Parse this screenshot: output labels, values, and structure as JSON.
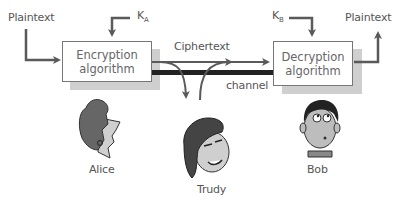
{
  "diagram": {
    "left_plaintext_label": "Plaintext",
    "right_plaintext_label": "Plaintext",
    "key_a": {
      "main": "K",
      "sub": "A"
    },
    "key_b": {
      "main": "K",
      "sub": "B"
    },
    "encryption_box": {
      "line1": "Encryption",
      "line2": "algorithm"
    },
    "decryption_box": {
      "line1": "Decryption",
      "line2": "algorithm"
    },
    "ciphertext_label": "Ciphertext",
    "channel_label": "channel",
    "characters": [
      {
        "name": "Alice"
      },
      {
        "name": "Trudy"
      },
      {
        "name": "Bob"
      }
    ],
    "colors": {
      "arrow": "#5a5a5a",
      "box_border": "#777777",
      "box_shadow": "#cfcfcf",
      "channel_bar": "#222222",
      "text": "#555555"
    }
  }
}
